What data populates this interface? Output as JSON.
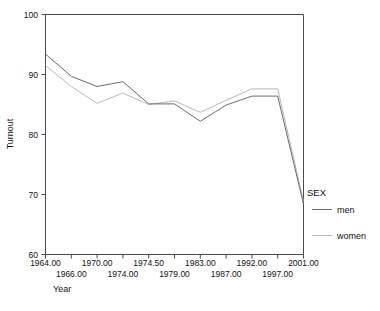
{
  "chart_data": {
    "type": "line",
    "title": "",
    "xlabel": "Year",
    "ylabel": "Turnout",
    "categories": [
      "1964.00",
      "1966.00",
      "1970.00",
      "1974.00",
      "1974.50",
      "1979.00",
      "1983.00",
      "1987.00",
      "1992.00",
      "1997.00",
      "2001.00"
    ],
    "x_tick_labels_row1": [
      "1964.00",
      "",
      "1970.00",
      "",
      "1974.50",
      "",
      "1983.00",
      "",
      "1992.00",
      "",
      "2001.00"
    ],
    "x_tick_labels_row2": [
      "",
      "1966.00",
      "",
      "1974.00",
      "",
      "1979.00",
      "",
      "1987.00",
      "",
      "1997.00",
      ""
    ],
    "ylim": [
      60,
      100
    ],
    "y_ticks": [
      "60",
      "70",
      "80",
      "90",
      "100"
    ],
    "y_tick_values": [
      60,
      70,
      80,
      90,
      100
    ],
    "grid": false,
    "legend_position": "right",
    "legend_title": "SEX",
    "series": [
      {
        "name": "men",
        "color": "#6b6b6b",
        "values": [
          93.4,
          89.7,
          88.0,
          88.8,
          85.1,
          85.1,
          82.2,
          84.9,
          86.4,
          86.4,
          68.4
        ]
      },
      {
        "name": "women",
        "color": "#b9b9b9",
        "values": [
          91.5,
          88.0,
          85.2,
          86.9,
          85.0,
          85.6,
          83.7,
          85.7,
          87.6,
          87.6,
          68.9
        ]
      }
    ]
  },
  "axes": {
    "y_axis_title": "Turnout",
    "x_axis_title": "Year"
  },
  "legend": {
    "title": "SEX",
    "entries": [
      {
        "label": "men",
        "color": "#6b6b6b"
      },
      {
        "label": "women",
        "color": "#b9b9b9"
      }
    ]
  },
  "colors": {
    "men_line": "#6b6b6b",
    "women_line": "#b9b9b9",
    "axis": "#4a4a4a",
    "text": "#111111",
    "background": "#ffffff"
  }
}
